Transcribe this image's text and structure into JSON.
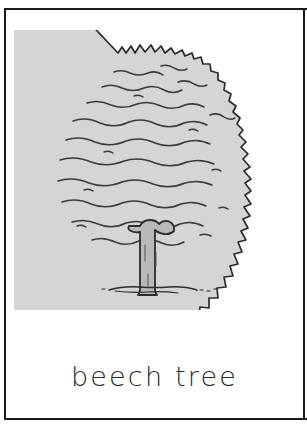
{
  "card": {
    "caption": "beech tree",
    "background_color": "#ffffff",
    "border_color": "#1b1b1b"
  },
  "illustration": {
    "name": "beech-tree-drawing",
    "subject": "beech tree",
    "style": "hand-drawn line illustration",
    "canopy_fill_color": "#d5d5d5",
    "trunk_fill_color": "#b9b9b9",
    "ink_color": "#2b2b2b",
    "parts": [
      {
        "name": "canopy",
        "label": "canopy"
      },
      {
        "name": "trunk",
        "label": "trunk"
      },
      {
        "name": "ground-line",
        "label": "ground"
      }
    ]
  }
}
